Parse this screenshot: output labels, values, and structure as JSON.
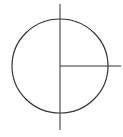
{
  "diagram": {
    "stroke_color": "#333333",
    "circle": {
      "cx": 60,
      "cy": 66,
      "rx": 48,
      "ry": 47
    },
    "vertical_line": {
      "x": 60,
      "y1": 4,
      "y2": 130
    },
    "radius_line": {
      "x1": 60,
      "y": 66,
      "x2": 121
    }
  }
}
